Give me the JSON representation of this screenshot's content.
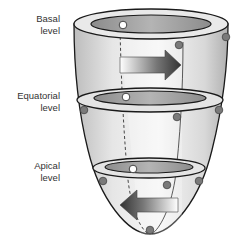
{
  "labels": {
    "basal": {
      "line1": "Basal",
      "line2": "level"
    },
    "equatorial": {
      "line1": "Equatorial",
      "line2": "level"
    },
    "apical": {
      "line1": "Apical",
      "line2": "level"
    }
  },
  "arrows": {
    "basal_direction": "right",
    "apical_direction": "left"
  },
  "colors": {
    "outline": "#1a1a1a",
    "body_light": "#f2f2f2",
    "body_mid": "#d0d0d0",
    "ring_inner": "#9a9a9a",
    "marker_filled": "#7a7a7a",
    "marker_open": "#ffffff"
  }
}
